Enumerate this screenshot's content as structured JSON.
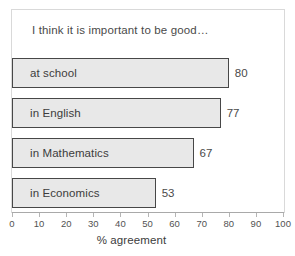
{
  "chart_data": {
    "type": "bar",
    "orientation": "horizontal",
    "title": "I think it is important to be good…",
    "categories": [
      "at school",
      "in English",
      "in Mathematics",
      "in Economics"
    ],
    "values": [
      80,
      77,
      67,
      53
    ],
    "value_labels": [
      "80",
      "77",
      "67",
      "53"
    ],
    "xlabel": "% agreement",
    "ylabel": "",
    "xlim": [
      0,
      100
    ],
    "xticks": [
      0,
      10,
      20,
      30,
      40,
      50,
      60,
      70,
      80,
      90,
      100
    ],
    "xtick_labels": [
      "0",
      "10",
      "20",
      "30",
      "40",
      "50",
      "60",
      "70",
      "80",
      "90",
      "100"
    ],
    "grid": false,
    "legend": null,
    "bar_fill_color": "#e8e8e8",
    "bar_border_color": "#474747",
    "frame_color": "#d9d9d9",
    "axis_color": "#a9a9a9",
    "text_color": "#3c3c3c"
  },
  "chart": {
    "title": "I think it is important to be good…",
    "axis_title": "% agreement",
    "bars": [
      {
        "label": "at school",
        "value": 80,
        "value_text": "80"
      },
      {
        "label": "in English",
        "value": 77,
        "value_text": "77"
      },
      {
        "label": "in Mathematics",
        "value": 67,
        "value_text": "67"
      },
      {
        "label": "in Economics",
        "value": 53,
        "value_text": "53"
      }
    ],
    "ticks": [
      "0",
      "10",
      "20",
      "30",
      "40",
      "50",
      "60",
      "70",
      "80",
      "90",
      "100"
    ]
  }
}
